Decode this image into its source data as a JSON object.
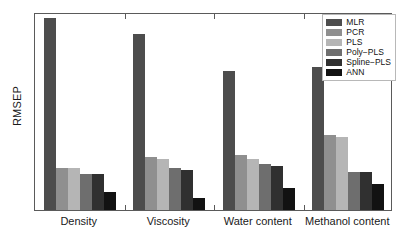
{
  "chart_data": {
    "type": "bar",
    "title": "",
    "xlabel": "",
    "ylabel": "RMSEP",
    "categories": [
      "Density",
      "Viscosity",
      "Water content",
      "Methanol content"
    ],
    "ylim": [
      0,
      100
    ],
    "grid": false,
    "y_ticks_labeled": false,
    "legend_position": "top-right",
    "series": [
      {
        "name": "MLR",
        "color": "#4d4d4d",
        "values": [
          97,
          89,
          70,
          72
        ]
      },
      {
        "name": "PCR",
        "color": "#8f8f8f",
        "values": [
          21,
          27,
          28,
          38
        ]
      },
      {
        "name": "PLS",
        "color": "#b5b5b5",
        "values": [
          21,
          26,
          26,
          37
        ]
      },
      {
        "name": "Poly-PLS",
        "color": "#6e6e6e",
        "values": [
          18,
          21,
          23,
          19
        ]
      },
      {
        "name": "Spline-PLS",
        "color": "#303030",
        "values": [
          18,
          20,
          22,
          19
        ]
      },
      {
        "name": "ANN",
        "color": "#121212",
        "values": [
          9,
          6,
          11,
          13
        ]
      }
    ],
    "legend_labels": [
      "MLR",
      "PCR",
      "PLS",
      "Poly−PLS",
      "Spline−PLS",
      "ANN"
    ]
  },
  "axes": {
    "ylabel": "RMSEP",
    "frame_color": "#5a5a5a"
  }
}
